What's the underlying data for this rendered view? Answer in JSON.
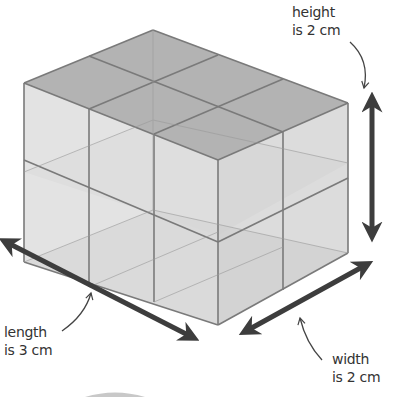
{
  "figure": {
    "type": "cuboid-volume-diagram",
    "cube_count": 12,
    "dimensions": {
      "length_cm": 3,
      "width_cm": 2,
      "height_cm": 2
    }
  },
  "labels": {
    "height": {
      "line1": "height",
      "line2": "is 2 cm"
    },
    "length": {
      "line1": "length",
      "line2": "is 3 cm"
    },
    "width": {
      "line1": "width",
      "line2": "is 2 cm"
    }
  },
  "colors": {
    "edge": "#7a7a7a",
    "top_face": "#b5b5b5",
    "front_face": "#d9d9d9",
    "side_face": "#d2d2d2",
    "arrow": "#3d3d3d",
    "text": "#333333"
  }
}
